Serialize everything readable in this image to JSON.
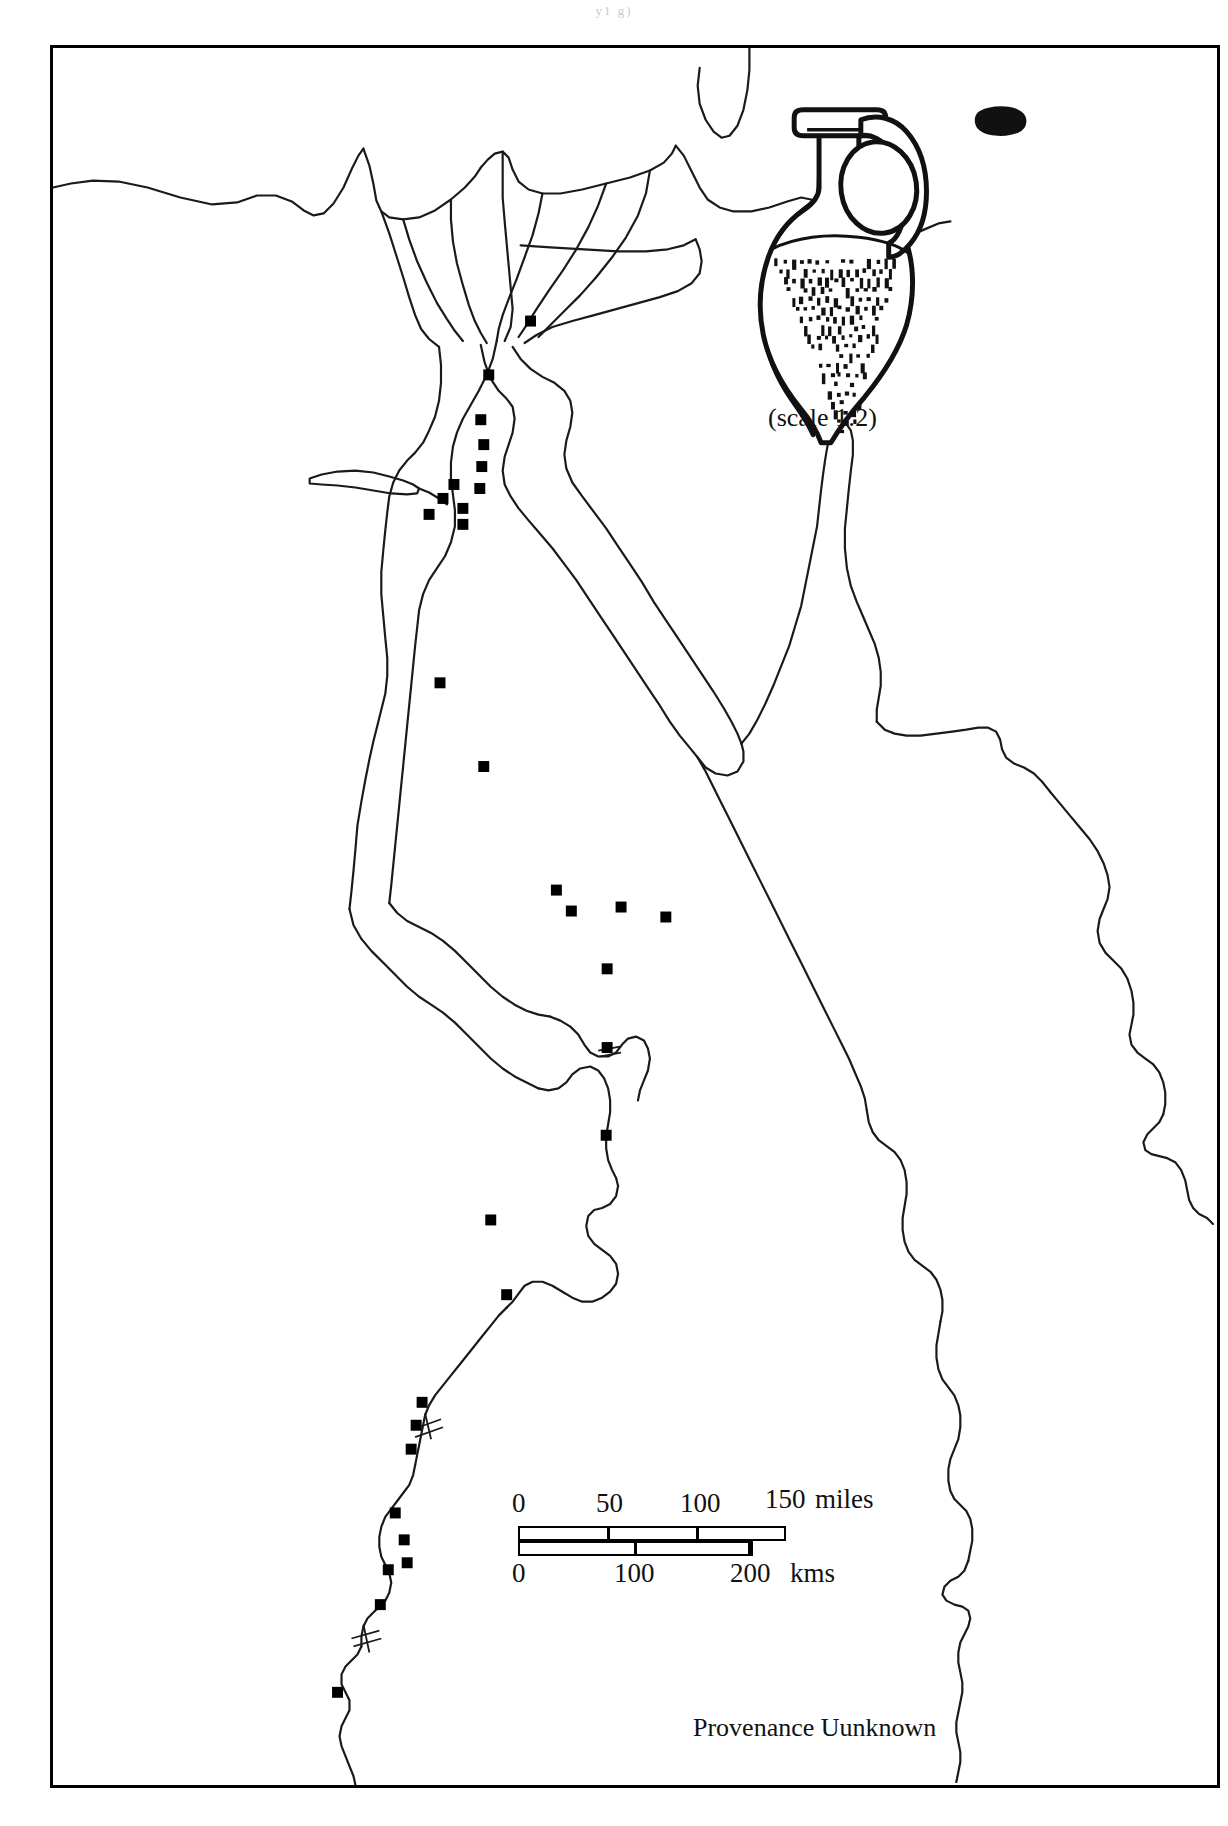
{
  "page": {
    "header_fragment": "y1   g)",
    "background_color": "#ffffff",
    "ink_color": "#000000"
  },
  "map": {
    "region": "Egypt",
    "frame": {
      "border_color": "#000000",
      "border_width_px": 3
    },
    "caption": "Provenance Uunknown",
    "features": [
      "Mediterranean coast",
      "Nile Delta with distributary branches",
      "Nile valley",
      "Faiyum oasis",
      "Gulf of Suez",
      "Gulf of Aqaba",
      "Sinai peninsula",
      "Red Sea coast"
    ]
  },
  "inset": {
    "object": "amphora",
    "scale_label": "(scale 1:2)",
    "has_rim_profile_swatch": true,
    "decoration": "dotted and dashed surface hatching on body"
  },
  "scalebar": {
    "miles": {
      "unit_label": "miles",
      "ticks": [
        "0",
        "50",
        "100",
        "150"
      ],
      "max": 150
    },
    "kms": {
      "unit_label": "kms",
      "ticks": [
        "0",
        "100",
        "200"
      ],
      "max": 200
    }
  },
  "site_markers": {
    "symbol": "filled-square",
    "color": "#000000",
    "count": 31,
    "points": [
      {
        "x": 480,
        "y": 274,
        "region": "eastern Delta"
      },
      {
        "x": 438,
        "y": 328,
        "region": "apex of Delta"
      },
      {
        "x": 430,
        "y": 373,
        "region": "Memphis area"
      },
      {
        "x": 433,
        "y": 398,
        "region": "Memphis area"
      },
      {
        "x": 431,
        "y": 420,
        "region": "Memphis area"
      },
      {
        "x": 429,
        "y": 442,
        "region": "Memphis area"
      },
      {
        "x": 412,
        "y": 478,
        "region": "Faiyum entrance"
      },
      {
        "x": 403,
        "y": 438,
        "region": "north of Faiyum"
      },
      {
        "x": 392,
        "y": 452,
        "region": "Faiyum"
      },
      {
        "x": 412,
        "y": 462,
        "region": "Faiyum"
      },
      {
        "x": 378,
        "y": 468,
        "region": "Faiyum west"
      },
      {
        "x": 389,
        "y": 637,
        "region": "middle Egypt"
      },
      {
        "x": 433,
        "y": 721,
        "region": "middle Egypt"
      },
      {
        "x": 506,
        "y": 845,
        "region": "middle Egypt"
      },
      {
        "x": 521,
        "y": 866,
        "region": "middle Egypt"
      },
      {
        "x": 571,
        "y": 862,
        "region": "middle Egypt"
      },
      {
        "x": 616,
        "y": 872,
        "region": "middle Egypt"
      },
      {
        "x": 557,
        "y": 924,
        "region": "middle Egypt"
      },
      {
        "x": 557,
        "y": 1003,
        "region": "upper Egypt"
      },
      {
        "x": 556,
        "y": 1091,
        "region": "upper Egypt"
      },
      {
        "x": 456,
        "y": 1251,
        "region": "Thebes area"
      },
      {
        "x": 371,
        "y": 1359,
        "region": "Thebes area"
      },
      {
        "x": 365,
        "y": 1382,
        "region": "Thebes area"
      },
      {
        "x": 360,
        "y": 1406,
        "region": "Thebes area"
      },
      {
        "x": 344,
        "y": 1470,
        "region": "Esna / Edfu"
      },
      {
        "x": 353,
        "y": 1497,
        "region": "Esna / Edfu"
      },
      {
        "x": 356,
        "y": 1520,
        "region": "Esna / Edfu"
      },
      {
        "x": 337,
        "y": 1527,
        "region": "Esna / Edfu"
      },
      {
        "x": 329,
        "y": 1562,
        "region": "Kom Ombo"
      },
      {
        "x": 286,
        "y": 1650,
        "region": "Aswan / First Cataract"
      },
      {
        "x": 440,
        "y": 1176,
        "region": "upper Egypt"
      }
    ]
  }
}
